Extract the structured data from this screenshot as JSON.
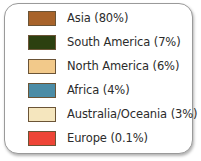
{
  "legend": {
    "title": "",
    "card": {
      "background": "#ffffff",
      "border_color": "#9a9a9a"
    },
    "items": [
      {
        "label": "Asia (80%)",
        "region": "Asia",
        "percent": "80%",
        "color": "#A8632A"
      },
      {
        "label": "South America (7%)",
        "region": "South America",
        "percent": "7%",
        "color": "#2C4010"
      },
      {
        "label": "North America (6%)",
        "region": "North America",
        "percent": "6%",
        "color": "#F2C98A"
      },
      {
        "label": "Africa (4%)",
        "region": "Africa",
        "percent": "4%",
        "color": "#4B8CA6"
      },
      {
        "label": "Australia/Oceania (3%)",
        "region": "Australia/Oceania",
        "percent": "3%",
        "color": "#F5E6BE"
      },
      {
        "label": "Europe (0.1%)",
        "region": "Europe",
        "percent": "0.1%",
        "color": "#EE4536"
      }
    ]
  },
  "chart_data": {
    "type": "pie",
    "title": "",
    "subtitle": "",
    "xlabel": "",
    "ylabel": "",
    "legend_position": "standalone",
    "grid": false,
    "categories": [
      "Asia",
      "South America",
      "North America",
      "Africa",
      "Australia/Oceania",
      "Europe"
    ],
    "values": [
      80,
      7,
      6,
      4,
      3,
      0.1
    ],
    "value_labels": [
      "80%",
      "7%",
      "6%",
      "4%",
      "3%",
      "0.1%"
    ],
    "colors": [
      "#A8632A",
      "#2C4010",
      "#F2C98A",
      "#4B8CA6",
      "#F5E6BE",
      "#EE4536"
    ],
    "units": "percent"
  }
}
